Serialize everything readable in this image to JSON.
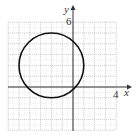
{
  "chart_data": {
    "type": "line",
    "title": "",
    "xlabel": "x",
    "ylabel": "y",
    "xlim": [
      -6,
      4
    ],
    "ylim": [
      -4,
      6
    ],
    "grid": true,
    "tick_labels": {
      "x": [
        "4"
      ],
      "y": [
        "6"
      ]
    },
    "series": [
      {
        "name": "circle",
        "shape": "circle",
        "center": [
          -2,
          2
        ],
        "radius": 3
      }
    ]
  },
  "labels": {
    "x_axis": "x",
    "y_axis": "y",
    "x_tick": "4",
    "y_tick": "6"
  },
  "colors": {
    "grid": "#9a9a9a",
    "axis": "#333333",
    "curve": "#111111"
  }
}
